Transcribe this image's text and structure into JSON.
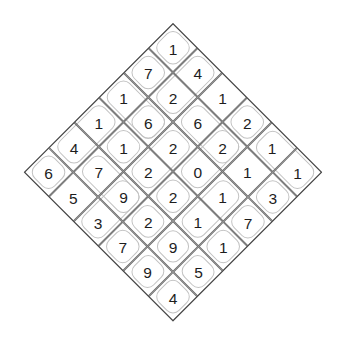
{
  "figure": {
    "name": "diamond-number-grid",
    "shape": "diamond",
    "rows": 6,
    "cols": 6,
    "background_color": "#ffffff",
    "grid_line_color": "#6f6f6f",
    "outer_border_color": "#4a4a4a",
    "cage_outline_color": "#c2c2c2",
    "digit_color": "#1d1d1d"
  },
  "chart_data": {
    "type": "table",
    "title": "",
    "xlabel": "",
    "ylabel": "",
    "grid": true,
    "legend": "none",
    "orientation": "rotated-45-diamond",
    "categories": [
      "c0",
      "c1",
      "c2",
      "c3",
      "c4",
      "c5"
    ],
    "row_labels": [
      "r0",
      "r1",
      "r2",
      "r3",
      "r4",
      "r5"
    ],
    "values": [
      [
        1,
        4,
        1,
        2,
        1,
        1
      ],
      [
        7,
        2,
        6,
        2,
        1,
        3
      ],
      [
        1,
        6,
        2,
        0,
        1,
        7
      ],
      [
        1,
        1,
        2,
        2,
        1,
        1
      ],
      [
        4,
        7,
        9,
        2,
        9,
        5
      ],
      [
        6,
        5,
        3,
        7,
        9,
        4
      ]
    ],
    "horizontal_center_row": [
      6,
      7,
      9,
      2,
      1,
      1
    ],
    "vertical_center_column": [
      1,
      2,
      2,
      2,
      9,
      4
    ],
    "top_apex_value": 1,
    "bottom_apex_value": 4,
    "left_apex_value": 6,
    "right_apex_value": 1
  },
  "cells": [
    {
      "r": 0,
      "c": 0,
      "v": "1"
    },
    {
      "r": 0,
      "c": 1,
      "v": "4"
    },
    {
      "r": 0,
      "c": 2,
      "v": "1"
    },
    {
      "r": 0,
      "c": 3,
      "v": "2"
    },
    {
      "r": 0,
      "c": 4,
      "v": "1"
    },
    {
      "r": 0,
      "c": 5,
      "v": "1"
    },
    {
      "r": 1,
      "c": 0,
      "v": "7"
    },
    {
      "r": 1,
      "c": 1,
      "v": "2"
    },
    {
      "r": 1,
      "c": 2,
      "v": "6"
    },
    {
      "r": 1,
      "c": 3,
      "v": "2"
    },
    {
      "r": 1,
      "c": 4,
      "v": "1"
    },
    {
      "r": 1,
      "c": 5,
      "v": "3"
    },
    {
      "r": 2,
      "c": 0,
      "v": "1"
    },
    {
      "r": 2,
      "c": 1,
      "v": "6"
    },
    {
      "r": 2,
      "c": 2,
      "v": "2"
    },
    {
      "r": 2,
      "c": 3,
      "v": "0"
    },
    {
      "r": 2,
      "c": 4,
      "v": "1"
    },
    {
      "r": 2,
      "c": 5,
      "v": "7"
    },
    {
      "r": 3,
      "c": 0,
      "v": "1"
    },
    {
      "r": 3,
      "c": 1,
      "v": "1"
    },
    {
      "r": 3,
      "c": 2,
      "v": "2"
    },
    {
      "r": 3,
      "c": 3,
      "v": "2"
    },
    {
      "r": 3,
      "c": 4,
      "v": "1"
    },
    {
      "r": 3,
      "c": 5,
      "v": "1"
    },
    {
      "r": 4,
      "c": 0,
      "v": "4"
    },
    {
      "r": 4,
      "c": 1,
      "v": "7"
    },
    {
      "r": 4,
      "c": 2,
      "v": "9"
    },
    {
      "r": 4,
      "c": 3,
      "v": "2"
    },
    {
      "r": 4,
      "c": 4,
      "v": "9"
    },
    {
      "r": 4,
      "c": 5,
      "v": "5"
    },
    {
      "r": 5,
      "c": 0,
      "v": "6"
    },
    {
      "r": 5,
      "c": 1,
      "v": "5"
    },
    {
      "r": 5,
      "c": 2,
      "v": "3"
    },
    {
      "r": 5,
      "c": 3,
      "v": "7"
    },
    {
      "r": 5,
      "c": 4,
      "v": "9"
    },
    {
      "r": 5,
      "c": 5,
      "v": "4"
    }
  ],
  "cages": [
    {
      "r": 0,
      "c": 0,
      "w": 1,
      "h": 1
    },
    {
      "r": 0,
      "c": 1,
      "w": 1,
      "h": 2
    },
    {
      "r": 0,
      "c": 3,
      "w": 1,
      "h": 1
    },
    {
      "r": 0,
      "c": 4,
      "w": 2,
      "h": 1
    },
    {
      "r": 1,
      "c": 0,
      "w": 1,
      "h": 1
    },
    {
      "r": 1,
      "c": 2,
      "w": 2,
      "h": 1
    },
    {
      "r": 1,
      "c": 3,
      "w": 1,
      "h": 2
    },
    {
      "r": 1,
      "c": 5,
      "w": 1,
      "h": 1
    },
    {
      "r": 2,
      "c": 0,
      "w": 2,
      "h": 1
    },
    {
      "r": 2,
      "c": 1,
      "w": 1,
      "h": 1
    },
    {
      "r": 2,
      "c": 2,
      "w": 1,
      "h": 2
    },
    {
      "r": 2,
      "c": 4,
      "w": 1,
      "h": 2
    },
    {
      "r": 2,
      "c": 5,
      "w": 1,
      "h": 1
    },
    {
      "r": 3,
      "c": 0,
      "w": 1,
      "h": 2
    },
    {
      "r": 3,
      "c": 1,
      "w": 1,
      "h": 1
    },
    {
      "r": 3,
      "c": 3,
      "w": 1,
      "h": 1
    },
    {
      "r": 3,
      "c": 5,
      "w": 1,
      "h": 1
    },
    {
      "r": 4,
      "c": 1,
      "w": 2,
      "h": 1
    },
    {
      "r": 4,
      "c": 2,
      "w": 1,
      "h": 2
    },
    {
      "r": 4,
      "c": 3,
      "w": 1,
      "h": 1
    },
    {
      "r": 4,
      "c": 4,
      "w": 1,
      "h": 1
    },
    {
      "r": 4,
      "c": 5,
      "w": 1,
      "h": 1
    },
    {
      "r": 5,
      "c": 0,
      "w": 1,
      "h": 1
    },
    {
      "r": 5,
      "c": 3,
      "w": 1,
      "h": 1
    },
    {
      "r": 5,
      "c": 4,
      "w": 1,
      "h": 1
    },
    {
      "r": 5,
      "c": 5,
      "w": 1,
      "h": 1
    }
  ]
}
